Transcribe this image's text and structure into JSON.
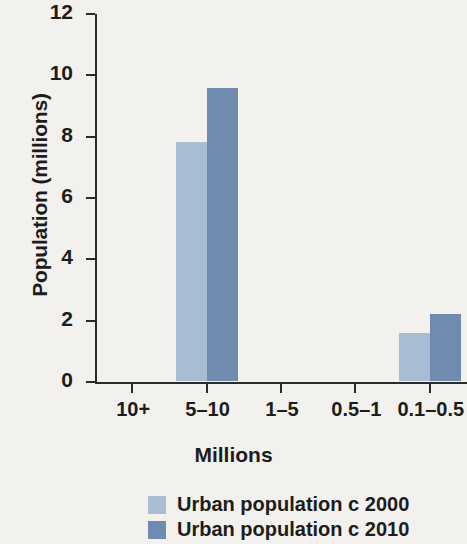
{
  "chart_data": {
    "type": "bar",
    "title": "",
    "xlabel": "Millions",
    "ylabel": "Population (millions)",
    "categories": [
      "10+",
      "5–10",
      "1–5",
      "0.5–1",
      "0.1–0.5"
    ],
    "series": [
      {
        "name": "Urban population c 2000",
        "color": "#a8bcd4",
        "values": [
          0,
          7.8,
          0,
          0,
          1.55
        ]
      },
      {
        "name": "Urban population c 2010",
        "color": "#6f8cb0",
        "values": [
          0,
          9.55,
          0,
          0,
          2.2
        ]
      }
    ],
    "ylim": [
      0,
      12
    ],
    "yticks": [
      0,
      2,
      4,
      6,
      8,
      10,
      12
    ],
    "ytick_labels": [
      "0",
      "2",
      "4",
      "6",
      "8",
      "10",
      "12"
    ],
    "grid": false,
    "legend_position": "bottom-center"
  },
  "axes": {
    "y_title": "Population (millions)",
    "x_title": "Millions"
  },
  "legend": {
    "entries": [
      {
        "label": "Urban population c 2000",
        "color": "#a8bcd4"
      },
      {
        "label": "Urban population c 2010",
        "color": "#6f8cb0"
      }
    ]
  },
  "colors": {
    "background": "#f3f1ed",
    "axis": "#2b2b2b",
    "text": "#1c1c1c",
    "series_2000": "#a8bcd4",
    "series_2010": "#6f8cb0"
  }
}
